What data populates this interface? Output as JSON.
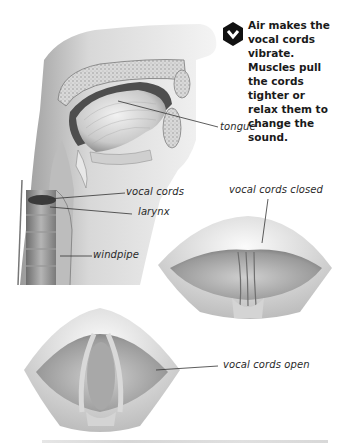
{
  "figure": {
    "callout": {
      "icon": "hexagon-chevron-down-icon",
      "icon_color": "#111111",
      "text": "Air makes the vocal cords vibrate. Muscles pull the cords tighter or relax them to change the sound."
    },
    "labels": {
      "tongue": "tongue",
      "vocal_cords": "vocal cords",
      "larynx": "larynx",
      "windpipe": "windpipe",
      "vocal_cords_closed": "vocal cords closed",
      "vocal_cords_open": "vocal cords open"
    },
    "panels": [
      {
        "name": "sagittal-head-neck-section",
        "description": "Cross-section of head and neck"
      },
      {
        "name": "glottis-closed-view",
        "description": "Top view of vocal cords closed"
      },
      {
        "name": "glottis-open-view",
        "description": "Top view of vocal cords open"
      }
    ]
  }
}
